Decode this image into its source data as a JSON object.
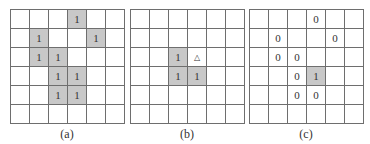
{
  "panels": [
    {
      "label": "(a)",
      "cells": [
        [
          "",
          "",
          "",
          "1",
          "",
          ""
        ],
        [
          "",
          "1",
          "",
          "",
          "1",
          ""
        ],
        [
          "",
          "1",
          "1",
          "",
          "",
          ""
        ],
        [
          "",
          "",
          "1",
          "1",
          "",
          ""
        ],
        [
          "",
          "",
          "1",
          "1",
          "",
          ""
        ],
        [
          "",
          "",
          "",
          "",
          "",
          ""
        ]
      ],
      "shaded": [
        [
          0,
          3
        ],
        [
          1,
          1
        ],
        [
          1,
          4
        ],
        [
          2,
          1
        ],
        [
          2,
          2
        ],
        [
          3,
          2
        ],
        [
          3,
          3
        ],
        [
          4,
          2
        ],
        [
          4,
          3
        ]
      ]
    },
    {
      "label": "(b)",
      "cells": [
        [
          "",
          "",
          "",
          "",
          "",
          ""
        ],
        [
          "",
          "",
          "",
          "",
          "",
          ""
        ],
        [
          "",
          "",
          "1",
          "△",
          "",
          ""
        ],
        [
          "",
          "",
          "1",
          "1",
          "",
          ""
        ],
        [
          "",
          "",
          "",
          "",
          "",
          ""
        ],
        [
          "",
          "",
          "",
          "",
          "",
          ""
        ]
      ],
      "shaded": [
        [
          2,
          2
        ],
        [
          3,
          2
        ],
        [
          3,
          3
        ]
      ]
    },
    {
      "label": "(c)",
      "cells": [
        [
          "",
          "",
          "",
          "0",
          "",
          ""
        ],
        [
          "",
          "0",
          "",
          "",
          "0",
          ""
        ],
        [
          "",
          "0",
          "0",
          "",
          "",
          ""
        ],
        [
          "",
          "",
          "0",
          "1",
          "",
          ""
        ],
        [
          "",
          "",
          "0",
          "0",
          "",
          ""
        ],
        [
          "",
          "",
          "",
          "",
          "",
          ""
        ]
      ],
      "shaded": [
        [
          3,
          3
        ]
      ]
    }
  ],
  "colors": {
    "shaded": "#c8c8c8",
    "grid_line": "#6e6e6e"
  }
}
